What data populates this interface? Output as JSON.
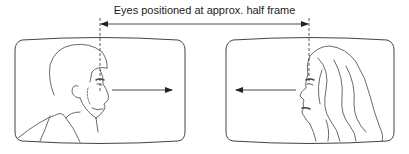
{
  "diagram": {
    "caption": "Eyes positioned at approx. half frame",
    "line_color": "#333333",
    "frames": [
      {
        "id": "left-frame",
        "subject": "man-profile-facing-right",
        "gaze_direction": "right"
      },
      {
        "id": "right-frame",
        "subject": "woman-profile-facing-left",
        "gaze_direction": "left"
      }
    ],
    "annotations": {
      "dimension_arrow": "double-headed arrow spanning between eye lines",
      "eye_lines": "dashed vertical lines through each subject's eyes"
    }
  }
}
